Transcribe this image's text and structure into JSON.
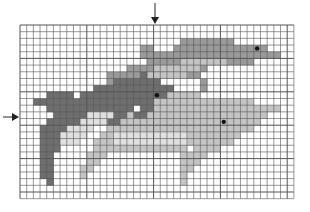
{
  "figure": {
    "type": "pixel-grid illustration",
    "grid": {
      "cols": 41,
      "rows": 26,
      "origin_x": 20,
      "origin_y": 25,
      "cell": 6.68,
      "line_color": "#555555"
    },
    "markers": {
      "top_arrow": {
        "x": 155,
        "label": ""
      },
      "left_arrow": {
        "y": 117,
        "label": ""
      }
    },
    "colors": {
      "dark": "#6e6e6e",
      "mid": "#9a9a9a",
      "light": "#c4c4c4",
      "lightest": "#e0e0e0",
      "outline": "#2a2a2a",
      "eye": "#111111"
    },
    "dolphins": [
      {
        "name": "dark-dolphin",
        "shade": "dark",
        "eye": {
          "col": 20,
          "row": 10
        }
      },
      {
        "name": "mid-dolphin",
        "shade": "mid",
        "eye": {
          "col": 35,
          "row": 3
        }
      },
      {
        "name": "light-dolphin",
        "shade": "light",
        "eye": {
          "col": 30,
          "row": 14
        }
      }
    ]
  }
}
